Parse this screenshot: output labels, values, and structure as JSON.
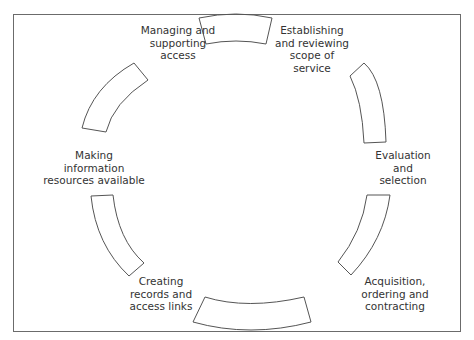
{
  "diagram": {
    "type": "cycle",
    "stages": [
      {
        "id": "scope",
        "label_lines": [
          "Establishing",
          "and reviewing",
          "scope of",
          "service"
        ]
      },
      {
        "id": "evaluation",
        "label_lines": [
          "Evaluation",
          "and",
          "selection"
        ]
      },
      {
        "id": "acquisition",
        "label_lines": [
          "Acquisition,",
          "ordering and",
          "contracting"
        ]
      },
      {
        "id": "records",
        "label_lines": [
          "Creating",
          "records and",
          "access links"
        ]
      },
      {
        "id": "making_available",
        "label_lines": [
          "Making",
          "information",
          "resources available"
        ]
      },
      {
        "id": "access",
        "label_lines": [
          "Managing and",
          "supporting",
          "access"
        ]
      }
    ],
    "colors": {
      "stroke": "#555555",
      "text": "#333333",
      "frame": "#6b6b6b",
      "background": "#ffffff"
    }
  }
}
